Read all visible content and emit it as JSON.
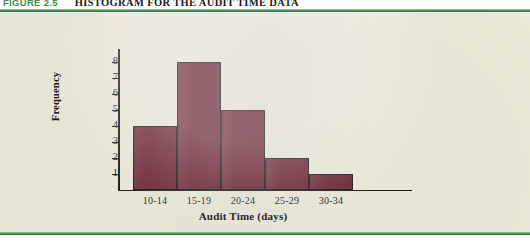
{
  "figure": {
    "label": "FIGURE 2.5",
    "title": "HISTOGRAM FOR THE AUDIT TIME DATA"
  },
  "colors": {
    "bar_fill": "#6d2733",
    "bar_stroke": "#1c1c1c",
    "panel_background": "#ecead9",
    "rule_green": "#4f9a5c",
    "axis": "#1c1c1c"
  },
  "chart_data": {
    "type": "bar",
    "title": "HISTOGRAM FOR THE AUDIT TIME DATA",
    "categories": [
      "10-14",
      "15-19",
      "20-24",
      "25-29",
      "30-34"
    ],
    "values": [
      4,
      8,
      5,
      2,
      1
    ],
    "xlabel": "Audit Time (days)",
    "ylabel": "Frequency",
    "ylim": [
      0,
      8
    ],
    "yticks": [
      1,
      2,
      3,
      4,
      5,
      6,
      7,
      8
    ],
    "ytick_labels": [
      "1",
      "2",
      "3",
      "4",
      "5",
      "6",
      "7",
      "8"
    ],
    "grid": false,
    "legend": false
  }
}
